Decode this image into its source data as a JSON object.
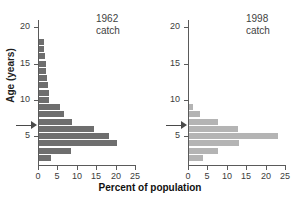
{
  "figure": {
    "xlabel": "Percent of population",
    "ylabel": "Age (years)"
  },
  "colors": {
    "bar_1962": "#6e6e6e",
    "bar_1998": "#b4b4b4",
    "axis": "#5a5a5a",
    "arrow": "#4a4a4a",
    "background": "#ffffff"
  },
  "panels": [
    {
      "id": "1962",
      "title": "1962\ncatch",
      "title_year": "1962",
      "title_word": "catch"
    },
    {
      "id": "1998",
      "title": "1998\ncatch",
      "title_year": "1998",
      "title_word": "catch"
    }
  ],
  "axes": {
    "x_ticks": [
      0,
      5,
      10,
      15,
      20,
      25
    ],
    "x_tick_labels": [
      "0",
      "5",
      "10",
      "15",
      "20",
      "25"
    ],
    "xlim": [
      0,
      25
    ],
    "y_ticks": [
      5,
      10,
      15,
      20
    ],
    "y_tick_labels": [
      "5",
      "10",
      "15",
      "20"
    ],
    "ylim": [
      1,
      21
    ],
    "grid": false
  },
  "marker": {
    "name": "age-of-maturity-arrow",
    "age_1962": 6.5,
    "age_1998": 6.5
  },
  "chart_data": {
    "type": "bar",
    "orientation": "horizontal",
    "title": "",
    "xlabel": "Percent of population",
    "ylabel": "Age (years)",
    "xlim": [
      0,
      25
    ],
    "ylim": [
      1,
      21
    ],
    "grid": false,
    "legend": "none",
    "categories": [
      2,
      3,
      4,
      5,
      6,
      7,
      8,
      9,
      10,
      11,
      12,
      13,
      14,
      15,
      16,
      17,
      18,
      19,
      20
    ],
    "category_label": "Age (years)",
    "series": [
      {
        "name": "1962 catch",
        "color": "#6e6e6e",
        "values": [
          3.0,
          8.2,
          20.0,
          18.0,
          14.3,
          8.6,
          6.4,
          5.5,
          2.7,
          2.6,
          2.3,
          2.0,
          1.8,
          1.7,
          1.5,
          1.4,
          1.3,
          0.0,
          0.0
        ]
      },
      {
        "name": "1998 catch",
        "color": "#b4b4b4",
        "values": [
          3.5,
          7.5,
          12.8,
          23.0,
          12.6,
          7.6,
          2.8,
          1.0,
          0.0,
          0.0,
          0.0,
          0.0,
          0.0,
          0.0,
          0.0,
          0.0,
          0.0,
          0.0,
          0.0
        ]
      }
    ]
  }
}
